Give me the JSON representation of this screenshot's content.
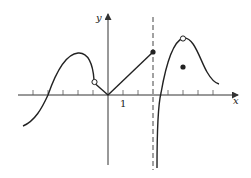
{
  "figure": {
    "x_axis_label": "x",
    "y_axis_label": "y",
    "tick_label_one": "1",
    "colors": {
      "curve": "#222222",
      "axis": "#333333",
      "background": "#ffffff"
    }
  },
  "graph_description": {
    "pieces": [
      {
        "name": "left-smooth-curve",
        "domain": "x < -1",
        "ends_with": "open circle at (-1, 0.6)"
      },
      {
        "name": "v-segment-left",
        "from": "(-1, 0.6)",
        "to": "(0, 0)"
      },
      {
        "name": "linear-segment",
        "from": "(0, 0)",
        "to": "(2, 1.6)",
        "endpoint": "closed dot at (2, 1.6)"
      },
      {
        "name": "vertical-asymptote",
        "x": 2,
        "style": "dashed"
      },
      {
        "name": "right-curve",
        "domain": "x > 2",
        "from": "-infinity near x=2",
        "peak": "open circle at (3, 2.5)"
      },
      {
        "name": "isolated-point",
        "at": "(3, 1.3)",
        "style": "closed dot"
      }
    ],
    "tick_spacing_units": 1,
    "x_ticks": [
      -6,
      -5,
      -4,
      -3,
      -2,
      -1,
      1,
      2,
      3,
      4,
      5,
      6,
      7
    ]
  }
}
